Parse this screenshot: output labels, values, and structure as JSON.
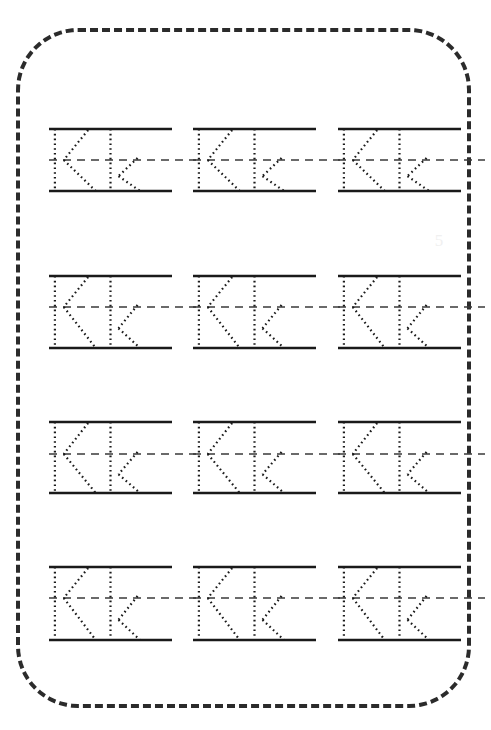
{
  "page": {
    "background_color": "#ffffff",
    "width": 491,
    "height": 730
  },
  "border": {
    "name": "dashed-rounded-border",
    "style": "dashed",
    "color": "#2b2b2b",
    "thickness": 4,
    "corner_radius": 62,
    "x": 16,
    "y": 28,
    "width": 455,
    "height": 680
  },
  "worksheet": {
    "letter_uppercase": "K",
    "letter_lowercase": "k",
    "pair_label": "Kk",
    "rows": 4,
    "columns": 3,
    "total_cells": 12,
    "solid_line_color": "#1a1a1a",
    "dashed_midline_color": "#3a3a3a",
    "trace_dot_color": "#1a1a1a",
    "solid_line_thickness": 2.6,
    "midline_dash_pattern": "8 6",
    "trace_dash_pattern": "1.6 3.2",
    "trace_thickness": 2.2,
    "row_tops": [
      129,
      276,
      422,
      567
    ],
    "row_midlines": [
      160,
      307,
      454,
      598
    ],
    "row_baselines": [
      191,
      348,
      493,
      640
    ],
    "column_lefts": [
      49,
      193,
      338
    ],
    "column_width": 123,
    "cells": [
      {
        "row": 1,
        "col": 1,
        "text": "Kk"
      },
      {
        "row": 1,
        "col": 2,
        "text": "Kk"
      },
      {
        "row": 1,
        "col": 3,
        "text": "Kk"
      },
      {
        "row": 2,
        "col": 1,
        "text": "Kk"
      },
      {
        "row": 2,
        "col": 2,
        "text": "Kk"
      },
      {
        "row": 2,
        "col": 3,
        "text": "Kk"
      },
      {
        "row": 3,
        "col": 1,
        "text": "Kk"
      },
      {
        "row": 3,
        "col": 2,
        "text": "Kk"
      },
      {
        "row": 3,
        "col": 3,
        "text": "Kk"
      },
      {
        "row": 4,
        "col": 1,
        "text": "Kk"
      },
      {
        "row": 4,
        "col": 2,
        "text": "Kk"
      },
      {
        "row": 4,
        "col": 3,
        "text": "Kk"
      }
    ]
  },
  "glyphs": {
    "uppercase_K": {
      "name": "uppercase-k-trace",
      "stem_x_ratio": 0.048,
      "arm_top_x_ratio": 0.318,
      "junction_x_ratio": 0.12,
      "leg_bottom_x_ratio": 0.38
    },
    "lowercase_k": {
      "name": "lowercase-k-trace",
      "stem_x_ratio": 0.5,
      "arm_top_x_ratio": 0.72,
      "junction_x_ratio": 0.565,
      "leg_bottom_x_ratio": 0.74,
      "x_height_start_ratio": 0.5
    }
  },
  "watermark": {
    "name": "faint-watermark",
    "text": "5",
    "color": "#f0f0f0"
  }
}
